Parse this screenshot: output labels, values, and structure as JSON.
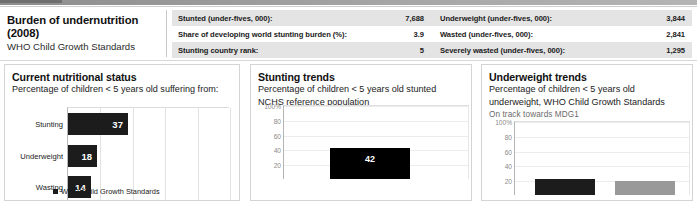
{
  "header": {
    "title": "Burden of undernutrition (2008)",
    "subtitle": "WHO Child Growth Standards",
    "rows": [
      {
        "left_label": "Stunted (under-fives, 000):",
        "left_value": "7,688",
        "right_label": "Underweight (under-fives, 000):",
        "right_value": "3,844"
      },
      {
        "left_label": "Share of developing world stunting burden (%):",
        "left_value": "3.9",
        "right_label": "Wasted (under-fives, 000):",
        "right_value": "2,841"
      },
      {
        "left_label": "Stunting country rank:",
        "left_value": "5",
        "right_label": "Severely wasted (under-fives, 000):",
        "right_value": "1,295"
      }
    ]
  },
  "panels": {
    "current": {
      "title": "Current nutritional status",
      "subtitle": "Percentage of children < 5 years old suffering from:",
      "legend_label": "WHO Child Growth Standards"
    },
    "stunting": {
      "title": "Stunting trends",
      "subtitle_line1": "Percentage of children < 5 years old stunted",
      "subtitle_line2": "NCHS reference population"
    },
    "underweight": {
      "title": "Underweight trends",
      "subtitle_line1": "Percentage of children < 5 years old",
      "subtitle_line2": "underweight, WHO Child Growth Standards",
      "note": "On track towards MDG1"
    }
  },
  "chart_data": [
    {
      "type": "bar",
      "orientation": "horizontal",
      "title": "Current nutritional status",
      "xlabel": "",
      "ylabel": "",
      "categories": [
        "Stunting",
        "Underweight",
        "Wasting"
      ],
      "values": [
        37,
        18,
        14
      ],
      "xlim": [
        0,
        100
      ],
      "grid": true,
      "legend": [
        "WHO Child Growth Standards"
      ],
      "legend_position": "bottom",
      "series_color": "#1c1c1c"
    },
    {
      "type": "bar",
      "orientation": "vertical",
      "title": "Stunting trends",
      "subtitle": "Percentage of children < 5 years old stunted, NCHS reference population",
      "xlabel": "",
      "ylabel": "",
      "categories": [
        ""
      ],
      "values": [
        42
      ],
      "ylim": [
        0,
        100
      ],
      "yticks": [
        "100%",
        "80",
        "60",
        "40",
        "20"
      ],
      "ytick_values": [
        100,
        80,
        60,
        40,
        20
      ],
      "grid": true,
      "series_color": "#000000"
    },
    {
      "type": "bar",
      "orientation": "vertical",
      "title": "Underweight trends",
      "subtitle": "Percentage of children < 5 years old underweight, WHO Child Growth Standards",
      "annotation": "On track towards MDG1",
      "xlabel": "",
      "ylabel": "",
      "categories": [
        "",
        ""
      ],
      "values": [
        22,
        19
      ],
      "ylim": [
        0,
        100
      ],
      "yticks": [
        "100%",
        "80",
        "60",
        "40",
        "20"
      ],
      "ytick_values": [
        100,
        80,
        60,
        40,
        20
      ],
      "grid": true,
      "series_colors": [
        "#1c1c1c",
        "#999999"
      ]
    }
  ]
}
